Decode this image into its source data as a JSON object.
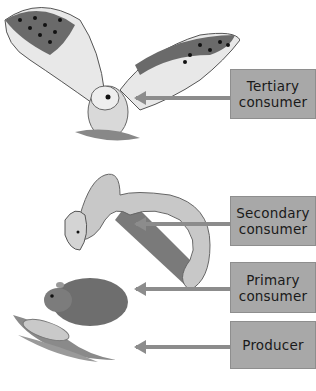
{
  "diagram": {
    "type": "food-chain",
    "levels": [
      {
        "organism": "owl",
        "label": "Tertiary consumer",
        "line1": "Tertiary",
        "line2": "consumer"
      },
      {
        "organism": "snake",
        "label": "Secondary consumer",
        "line1": "Secondary",
        "line2": "consumer"
      },
      {
        "organism": "mouse",
        "label": "Primary consumer",
        "line1": "Primary",
        "line2": "consumer"
      },
      {
        "organism": "corn",
        "label": "Producer",
        "line1": "Producer",
        "line2": ""
      }
    ]
  },
  "colors": {
    "box_fill": "#a8a8a8",
    "arrow": "#8c8c8c",
    "text": "#1a1a1a"
  }
}
